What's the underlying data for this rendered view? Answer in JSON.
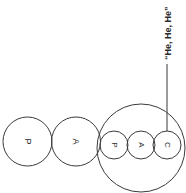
{
  "canvas": {
    "width": 186,
    "height": 193,
    "background": "#ffffff",
    "stroke_color": "#3a3a3a",
    "text_color": "#2b2b2b",
    "rotation_note": "90"
  },
  "diagram": {
    "nodes": [
      {
        "id": "node-p-large",
        "label": "P",
        "cx": 27.5,
        "cy": 141.5,
        "r": 24.5,
        "size": "large"
      },
      {
        "id": "node-a-large",
        "label": "A",
        "cx": 76,
        "cy": 141.5,
        "r": 24.5,
        "size": "large"
      },
      {
        "id": "node-p-small",
        "label": "P",
        "cx": 114,
        "cy": 145,
        "r": 14,
        "size": "small"
      },
      {
        "id": "node-a-small",
        "label": "A",
        "cx": 141,
        "cy": 145,
        "r": 14,
        "size": "small"
      },
      {
        "id": "node-c-small",
        "label": "C",
        "cx": 167,
        "cy": 145,
        "r": 14,
        "size": "small"
      }
    ],
    "group": {
      "id": "group-circle",
      "cx": 141,
      "cy": 148,
      "r": 44
    },
    "callout": {
      "text": "“He, He, He”",
      "leader": {
        "x1": 167,
        "y1": 131,
        "x2": 167,
        "y2": 64
      },
      "text_x": 168,
      "text_y": 60
    }
  }
}
